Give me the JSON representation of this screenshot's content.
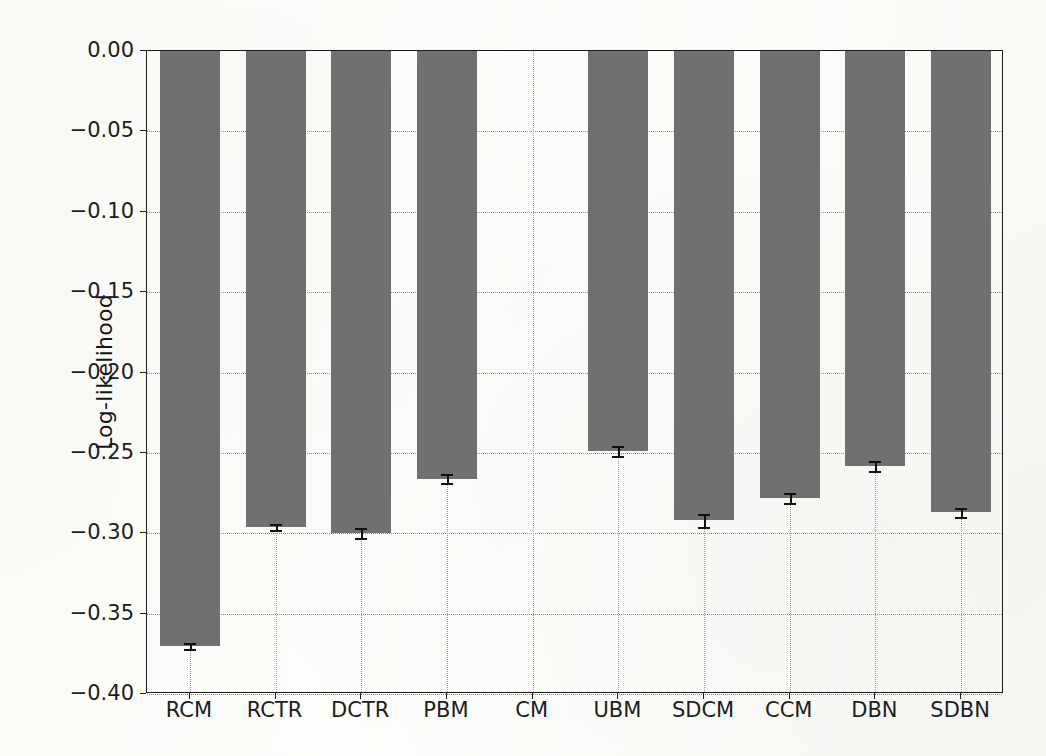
{
  "chart_data": {
    "type": "bar",
    "title": "",
    "subtitle": "",
    "xlabel": "",
    "ylabel": "Log-likelihood",
    "categories": [
      "RCM",
      "RCTR",
      "DCTR",
      "PBM",
      "CM",
      "UBM",
      "SDCM",
      "CCM",
      "DBN",
      "SDBN"
    ],
    "values": [
      -0.37,
      -0.296,
      -0.3,
      -0.266,
      0.0,
      -0.249,
      -0.292,
      -0.278,
      -0.258,
      -0.287
    ],
    "errors": [
      0.002,
      0.002,
      0.003,
      0.003,
      0.0,
      0.003,
      0.004,
      0.003,
      0.003,
      0.003
    ],
    "ylim": [
      -0.4,
      0.0
    ],
    "xlim": [
      0,
      10
    ],
    "ytick_labels": [
      "0.00",
      "-0.05",
      "-0.10",
      "-0.15",
      "-0.20",
      "-0.25",
      "-0.30",
      "-0.35",
      "-0.40"
    ],
    "ytick_values": [
      0.0,
      -0.05,
      -0.1,
      -0.15,
      -0.2,
      -0.25,
      -0.3,
      -0.35,
      -0.4
    ],
    "grid": true,
    "grid_style": "dotted",
    "legend": null,
    "legend_position": "none",
    "bar_color": "#707070",
    "error_color": "#111111",
    "axis_color": "#1a1a1a",
    "background_color": "#fbfbf9"
  }
}
